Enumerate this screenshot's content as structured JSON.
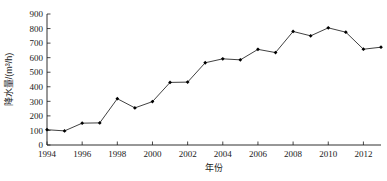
{
  "chart_data": {
    "type": "line",
    "title": "",
    "xlabel": "年份",
    "ylabel": "降水量/(m³/h)",
    "xlim": [
      1994,
      2013
    ],
    "ylim": [
      0,
      900
    ],
    "grid": false,
    "legend": null,
    "x": [
      1994,
      1995,
      1996,
      1997,
      1998,
      1999,
      2000,
      2001,
      2002,
      2003,
      2004,
      2005,
      2006,
      2007,
      2008,
      2009,
      2010,
      2011,
      2012,
      2013
    ],
    "values": [
      105,
      97,
      150,
      152,
      318,
      255,
      298,
      430,
      432,
      565,
      592,
      585,
      657,
      635,
      780,
      750,
      805,
      775,
      658,
      672
    ],
    "series": [
      {
        "name": "降水量",
        "values": [
          105,
          97,
          150,
          152,
          318,
          255,
          298,
          430,
          432,
          565,
          592,
          585,
          657,
          635,
          780,
          750,
          805,
          775,
          658,
          672
        ]
      }
    ],
    "y_tick_labels": [
      "0",
      "100",
      "200",
      "300",
      "400",
      "500",
      "600",
      "700",
      "800",
      "900"
    ],
    "y_ticks": [
      0,
      100,
      200,
      300,
      400,
      500,
      600,
      700,
      800,
      900
    ],
    "x_tick_labels": [
      "1994",
      "1996",
      "1998",
      "2000",
      "2002",
      "2004",
      "2006",
      "2008",
      "2010",
      "2012"
    ],
    "x_ticks": [
      1994,
      1996,
      1998,
      2000,
      2002,
      2004,
      2006,
      2008,
      2010,
      2012
    ],
    "marker": "filled-diamond",
    "line_color": "#2b2b2b",
    "marker_color": "#000000",
    "background_color": "#ffffff"
  }
}
